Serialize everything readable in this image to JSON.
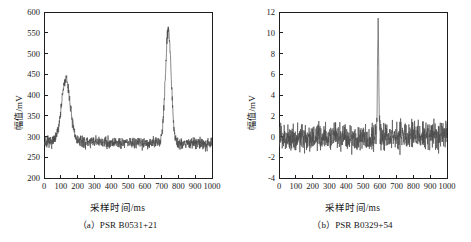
{
  "figure": {
    "panel_a": {
      "caption": "（a）PSR B0531+21",
      "xlabel": "采样时间/ms",
      "ylabel": "幅值/mV"
    },
    "panel_b": {
      "caption": "（b）PSR B0329+54",
      "xlabel": "采样时间/ms",
      "ylabel": "幅值/mV"
    }
  },
  "chart_data": [
    {
      "type": "line",
      "title": "（a）PSR B0531+21",
      "xlabel": "采样时间/ms",
      "ylabel": "幅值/mV",
      "xlim": [
        0,
        1000
      ],
      "ylim": [
        200,
        600
      ],
      "xticks": [
        0,
        100,
        200,
        300,
        400,
        500,
        600,
        700,
        800,
        900,
        1000
      ],
      "yticks": [
        200,
        250,
        300,
        350,
        400,
        450,
        500,
        550,
        600
      ],
      "grid": false,
      "legend": "none",
      "line_color": "#4a4a4a",
      "baseline": 285,
      "noise_amplitude": 14,
      "peaks": [
        {
          "center": 130,
          "height": 150,
          "width": 26,
          "label": "main pulse"
        },
        {
          "center": 740,
          "height": 275,
          "width": 17,
          "label": "interpulse/main peak"
        }
      ],
      "x": [
        0,
        25,
        50,
        75,
        100,
        115,
        125,
        130,
        140,
        150,
        160,
        175,
        200,
        250,
        300,
        350,
        400,
        450,
        500,
        550,
        600,
        650,
        680,
        700,
        715,
        730,
        740,
        750,
        760,
        775,
        800,
        850,
        900,
        950,
        1000
      ],
      "y": [
        330,
        330,
        335,
        345,
        380,
        415,
        430,
        437,
        420,
        395,
        360,
        330,
        300,
        283,
        280,
        282,
        278,
        283,
        280,
        279,
        283,
        288,
        300,
        330,
        400,
        500,
        558,
        505,
        420,
        350,
        305,
        288,
        285,
        282,
        290
      ]
    },
    {
      "type": "line",
      "title": "（b）PSR B0329+54",
      "xlabel": "采样时间/ms",
      "ylabel": "幅值/mV",
      "xlim": [
        0,
        1000
      ],
      "ylim": [
        -4,
        12
      ],
      "xticks": [
        0,
        100,
        200,
        300,
        400,
        500,
        600,
        700,
        800,
        900,
        1000
      ],
      "yticks": [
        -4,
        -2,
        0,
        2,
        4,
        6,
        8,
        10,
        12
      ],
      "grid": false,
      "legend": "none",
      "line_color": "#4a4a4a",
      "baseline": 0,
      "noise_amplitude": 1.3,
      "peaks": [
        {
          "center": 590,
          "height": 10.2,
          "width": 4,
          "label": "main pulse"
        }
      ],
      "x": [
        0,
        50,
        100,
        150,
        200,
        250,
        300,
        350,
        400,
        450,
        500,
        540,
        570,
        580,
        588,
        592,
        600,
        610,
        640,
        680,
        720,
        760,
        800,
        850,
        900,
        950,
        1000
      ],
      "y": [
        0.1,
        0.3,
        -0.4,
        0.5,
        -0.2,
        0.4,
        -0.6,
        0.3,
        0.2,
        -0.3,
        0.5,
        0.8,
        1.2,
        2.5,
        10.2,
        5.0,
        1.4,
        0.6,
        0.3,
        0.2,
        0.6,
        0.4,
        -0.2,
        0.3,
        0.1,
        0.4,
        0.0
      ]
    }
  ]
}
